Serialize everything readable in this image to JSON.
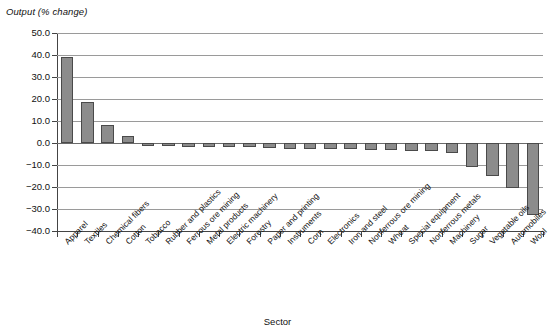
{
  "chart_data": {
    "type": "bar",
    "title": "",
    "ylabel": "Output (% change)",
    "xlabel": "Sector",
    "ylim": [
      -40.0,
      50.0
    ],
    "ytick_labels": [
      "50.0",
      "40.0",
      "30.0",
      "20.0",
      "10.0",
      "0.0",
      "-10.0",
      "-20.0",
      "-30.0",
      "-40.0"
    ],
    "ytick_values": [
      50,
      40,
      30,
      20,
      10,
      0,
      -10,
      -20,
      -30,
      -40
    ],
    "grid": true,
    "legend": null,
    "bar_color": "#8c8c8c",
    "bar_edge_color": "#4a4a4a",
    "categories": [
      "Apparel",
      "Textiles",
      "Chemical fibers",
      "Cotton",
      "Tobacco",
      "Rubber and plastics",
      "Ferrous ore mining",
      "Metal products",
      "Electric machinery",
      "Forestry",
      "Paper and printing",
      "Instruments",
      "Corn",
      "Electronics",
      "Iron and steel",
      "Nonferrous ore mining",
      "Wheat",
      "Special equipment",
      "Nonferrous metals",
      "Machinery",
      "Sugar",
      "Vegetable oils",
      "Automobiles",
      "Wool"
    ],
    "values": [
      39.0,
      18.5,
      8.2,
      3.2,
      -1.3,
      -1.3,
      -1.6,
      -1.7,
      -1.7,
      -2.0,
      -2.3,
      -2.5,
      -2.7,
      -2.8,
      -2.9,
      -3.0,
      -3.2,
      -3.6,
      -3.8,
      -4.7,
      -10.8,
      -15.1,
      -20.5,
      -32.8
    ]
  }
}
